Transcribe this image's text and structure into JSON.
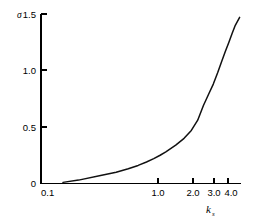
{
  "figure": {
    "background_color": "#ffffff",
    "curve_color": "#111111",
    "axis_color": "#000000"
  },
  "labels": {
    "y_axis_symbol": "σ",
    "x_axis_symbol": "k",
    "x_axis_subscript": "s",
    "y_tick_1_5": "1.5",
    "y_tick_1_0": "1.0",
    "y_tick_0_5": "0.5",
    "y_tick_0": "0",
    "x_tick_0_1": "0.1",
    "x_tick_1_0": "1.0",
    "x_tick_2_0": "2.0",
    "x_tick_3_0": "3.0",
    "x_tick_4_0": "4.0"
  },
  "chart_data": {
    "type": "line",
    "title": "",
    "subtitle": "",
    "xlabel": "k_s",
    "ylabel": "σ",
    "xscale": "log",
    "yscale": "linear",
    "xlim": [
      0.1,
      4.0
    ],
    "ylim": [
      0,
      1.5
    ],
    "grid": false,
    "legend": null,
    "xticks": [
      0.1,
      1.0,
      2.0,
      3.0,
      4.0
    ],
    "xtick_labels": [
      "0.1",
      "1.0",
      "2.0",
      "3.0",
      "4.0"
    ],
    "yticks": [
      0,
      0.5,
      1.0,
      1.5
    ],
    "ytick_labels": [
      "0",
      "0.5",
      "1.0",
      "1.5"
    ],
    "series": [
      {
        "name": "sigma",
        "x": [
          0.15,
          0.2,
          0.3,
          0.4,
          0.5,
          0.6,
          0.7,
          0.8,
          0.9,
          1.0,
          1.2,
          1.4,
          1.6,
          1.8,
          2.0,
          2.2,
          2.4,
          2.6,
          2.8,
          3.0,
          3.2,
          3.4,
          3.6,
          3.9
        ],
        "y": [
          0.01,
          0.03,
          0.07,
          0.1,
          0.13,
          0.16,
          0.19,
          0.22,
          0.25,
          0.28,
          0.34,
          0.4,
          0.47,
          0.56,
          0.69,
          0.79,
          0.88,
          0.98,
          1.08,
          1.17,
          1.25,
          1.33,
          1.4,
          1.47
        ]
      }
    ]
  }
}
